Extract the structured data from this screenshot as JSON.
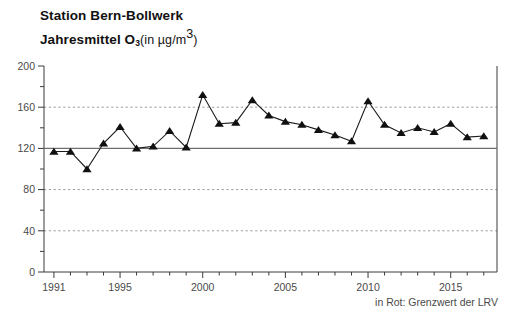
{
  "header": {
    "title_line1": "Station Bern-Bollwerk",
    "title_line2_main": "Jahresmittel O",
    "title_line2_sub": "3",
    "title_line2_rest": "(in µg/m",
    "title_line2_sup": "3",
    "title_line2_close": ")"
  },
  "footer": {
    "note": "in Rot: Grenzwert der LRV"
  },
  "chart_data": {
    "type": "line",
    "xlabel": "",
    "ylabel": "",
    "xlim": [
      1990.4,
      2017.8
    ],
    "ylim": [
      0,
      200
    ],
    "yticks": [
      0,
      40,
      80,
      120,
      160,
      200
    ],
    "ytick_labels": [
      "0",
      "40",
      "80",
      "120",
      "160",
      "200"
    ],
    "yminor_ticks": [
      20,
      60,
      100,
      140,
      180
    ],
    "xticks": [
      1991,
      1995,
      2000,
      2005,
      2010,
      2015
    ],
    "xtick_labels": [
      "1991",
      "1995",
      "2000",
      "2005",
      "2010",
      "2015"
    ],
    "grid": "horizontal-dashed-at-40-80-160",
    "legend": "none",
    "marker": "triangle-up-filled",
    "marker_color": "#101010",
    "line_color": "#1a1a1a",
    "limit_line": {
      "label": "Grenzwert der LRV",
      "value": 120,
      "color": "#6f6f6f"
    },
    "x": [
      1991,
      1992,
      1993,
      1994,
      1995,
      1996,
      1997,
      1998,
      1999,
      2000,
      2001,
      2002,
      2003,
      2004,
      2005,
      2006,
      2007,
      2008,
      2009,
      2010,
      2011,
      2012,
      2013,
      2014,
      2015,
      2016,
      2017
    ],
    "values": [
      117,
      117,
      100,
      125,
      141,
      120,
      122,
      137,
      121,
      172,
      144,
      145,
      167,
      152,
      146,
      143,
      138,
      133,
      127,
      166,
      143,
      135,
      140,
      136,
      144,
      131,
      132
    ],
    "series": [
      {
        "name": "Jahresmittel O3",
        "values": [
          117,
          117,
          100,
          125,
          141,
          120,
          122,
          137,
          121,
          172,
          144,
          145,
          167,
          152,
          146,
          143,
          138,
          133,
          127,
          166,
          143,
          135,
          140,
          136,
          144,
          131,
          132
        ]
      }
    ]
  }
}
